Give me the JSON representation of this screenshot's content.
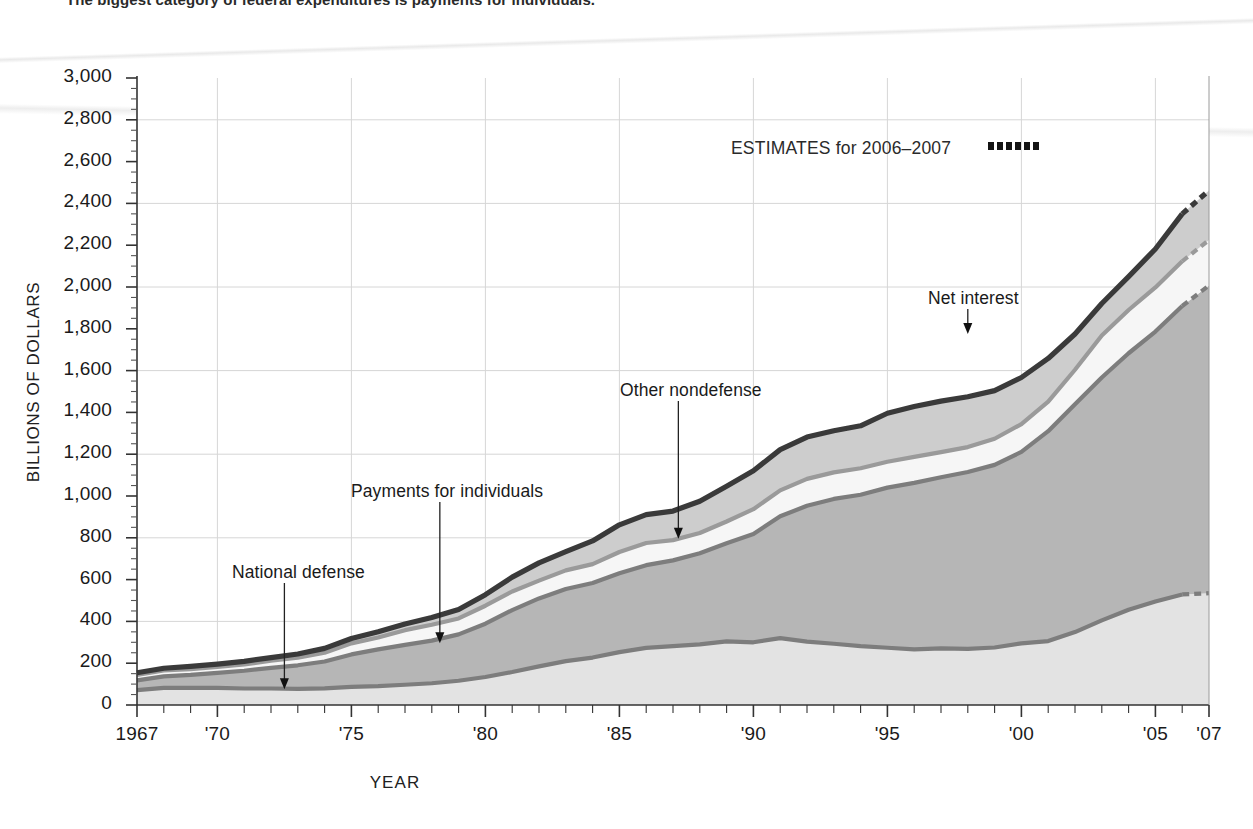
{
  "caption": "The biggest category of federal expenditures is payments for individuals.",
  "chart_data": {
    "type": "area",
    "stacked": true,
    "title": "",
    "xlabel": "YEAR",
    "ylabel": "BILLIONS OF DOLLARS",
    "xlim": [
      1967,
      2007
    ],
    "ylim": [
      0,
      3000
    ],
    "grid": true,
    "legend_position": "inline-annotations",
    "x": [
      1967,
      1968,
      1969,
      1970,
      1971,
      1972,
      1973,
      1974,
      1975,
      1976,
      1977,
      1978,
      1979,
      1980,
      1981,
      1982,
      1983,
      1984,
      1985,
      1986,
      1987,
      1988,
      1989,
      1990,
      1991,
      1992,
      1993,
      1994,
      1995,
      1996,
      1997,
      1998,
      1999,
      2000,
      2001,
      2002,
      2003,
      2004,
      2005,
      2006,
      2007
    ],
    "xticklabels": [
      "1967",
      "'70",
      "'75",
      "'80",
      "'85",
      "'90",
      "'95",
      "'00",
      "'05",
      "'07"
    ],
    "xtickvalues": [
      1967,
      1970,
      1975,
      1980,
      1985,
      1990,
      1995,
      2000,
      2005,
      2007
    ],
    "yticklabels": [
      "0",
      "200",
      "400",
      "600",
      "800",
      "1,000",
      "1,200",
      "1,400",
      "1,600",
      "1,800",
      "2,000",
      "2,200",
      "2,400",
      "2,600",
      "2,800",
      "3,000"
    ],
    "ytickvalues": [
      0,
      200,
      400,
      600,
      800,
      1000,
      1200,
      1400,
      1600,
      1800,
      2000,
      2200,
      2400,
      2600,
      2800,
      3000
    ],
    "ytick_step_minor": 50,
    "estimate_years": [
      2006,
      2007
    ],
    "series": [
      {
        "name": "National defense",
        "order": 1,
        "fill": "#e3e3e3",
        "line": "#7d7d7d",
        "values": [
          71,
          82,
          82,
          82,
          79,
          79,
          77,
          80,
          87,
          90,
          97,
          104,
          116,
          134,
          158,
          185,
          210,
          227,
          253,
          273,
          282,
          290,
          304,
          300,
          320,
          303,
          293,
          282,
          274,
          266,
          271,
          269,
          275,
          295,
          306,
          349,
          405,
          456,
          495,
          529,
          535
        ]
      },
      {
        "name": "Payments for individuals",
        "order": 2,
        "fill": "#b6b6b6",
        "line": "#7d7d7d",
        "values": [
          47,
          55,
          62,
          72,
          85,
          99,
          113,
          128,
          155,
          176,
          191,
          204,
          222,
          255,
          296,
          325,
          345,
          357,
          377,
          396,
          410,
          436,
          470,
          518,
          583,
          650,
          693,
          724,
          766,
          797,
          819,
          846,
          874,
          916,
          1004,
          1090,
          1162,
          1227,
          1292,
          1380,
          1472
        ]
      },
      {
        "name": "Other nondefense",
        "order": 3,
        "fill": "#f6f6f6",
        "line": "#9a9a9a",
        "values": [
          26,
          28,
          28,
          28,
          30,
          34,
          37,
          42,
          53,
          57,
          70,
          76,
          76,
          86,
          89,
          85,
          89,
          90,
          102,
          106,
          97,
          97,
          104,
          119,
          124,
          129,
          127,
          127,
          124,
          124,
          120,
          119,
          125,
          133,
          142,
          165,
          201,
          207,
          211,
          214,
          218
        ]
      },
      {
        "name": "Net interest",
        "order": 4,
        "fill": "#cdcdcd",
        "line": "#3a3a3a",
        "values": [
          10,
          11,
          13,
          14,
          15,
          15,
          17,
          21,
          23,
          27,
          30,
          35,
          43,
          53,
          69,
          85,
          90,
          111,
          130,
          136,
          139,
          152,
          169,
          184,
          195,
          200,
          199,
          203,
          232,
          241,
          244,
          241,
          230,
          223,
          206,
          171,
          153,
          160,
          184,
          227,
          237
        ]
      }
    ],
    "annotations": [
      {
        "label": "National defense",
        "target_year": 1972.5,
        "target_value": 75
      },
      {
        "label": "Payments for individuals",
        "target_year": 1978.3,
        "target_value": 295
      },
      {
        "label": "Other nondefense",
        "target_year": 1987.2,
        "target_value": 795
      },
      {
        "label": "Net interest",
        "target_year": 1998.0,
        "target_value": 1775
      }
    ],
    "estimates_note": "ESTIMATES for 2006–2007"
  }
}
